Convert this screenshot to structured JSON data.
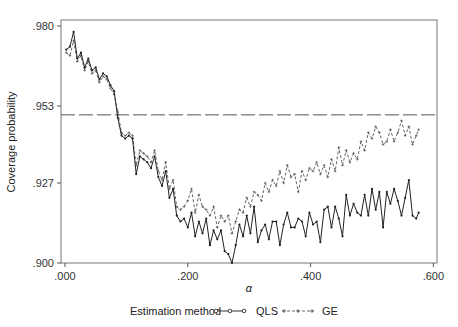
{
  "chart_data": {
    "type": "line",
    "title": "",
    "xlabel": "α",
    "ylabel": "Coverage probability",
    "xlim": [
      0.0,
      0.6
    ],
    "ylim": [
      0.9,
      0.98
    ],
    "x_ticks": [
      ".000",
      ".200",
      ".400",
      ".600"
    ],
    "x_tick_values": [
      0.0,
      0.2,
      0.4,
      0.6
    ],
    "y_ticks": [
      ".900",
      ".927",
      ".953",
      ".980"
    ],
    "y_tick_values": [
      0.9,
      0.927,
      0.953,
      0.98
    ],
    "grid": false,
    "reference_line": {
      "y": 0.95,
      "style": "long-dash"
    },
    "legend": {
      "title": "Estimation method",
      "position": "bottom",
      "entries": [
        {
          "label": "QLS",
          "style": "solid-circle-markers"
        },
        {
          "label": "GE",
          "style": "dashed-plus-markers"
        }
      ]
    },
    "x": [
      0.002,
      0.008,
      0.014,
      0.02,
      0.026,
      0.032,
      0.038,
      0.044,
      0.05,
      0.056,
      0.062,
      0.068,
      0.074,
      0.08,
      0.086,
      0.092,
      0.098,
      0.104,
      0.11,
      0.116,
      0.122,
      0.128,
      0.134,
      0.14,
      0.146,
      0.152,
      0.158,
      0.164,
      0.17,
      0.176,
      0.182,
      0.188,
      0.194,
      0.2,
      0.206,
      0.212,
      0.218,
      0.224,
      0.23,
      0.236,
      0.242,
      0.248,
      0.254,
      0.26,
      0.266,
      0.272,
      0.278,
      0.284,
      0.29,
      0.296,
      0.302,
      0.308,
      0.314,
      0.32,
      0.326,
      0.332,
      0.338,
      0.344,
      0.35,
      0.356,
      0.362,
      0.368,
      0.374,
      0.38,
      0.386,
      0.392,
      0.398,
      0.404,
      0.41,
      0.416,
      0.422,
      0.428,
      0.434,
      0.44,
      0.446,
      0.452,
      0.458,
      0.464,
      0.47,
      0.476,
      0.482,
      0.488,
      0.494,
      0.5,
      0.506,
      0.512,
      0.518,
      0.524,
      0.53,
      0.536,
      0.542,
      0.548,
      0.554,
      0.56,
      0.566,
      0.572,
      0.576
    ],
    "series": [
      {
        "name": "QLS",
        "values": [
          0.972,
          0.973,
          0.978,
          0.969,
          0.971,
          0.966,
          0.969,
          0.965,
          0.966,
          0.962,
          0.964,
          0.963,
          0.96,
          0.958,
          0.949,
          0.943,
          0.942,
          0.943,
          0.942,
          0.93,
          0.936,
          0.935,
          0.934,
          0.932,
          0.936,
          0.929,
          0.926,
          0.931,
          0.922,
          0.925,
          0.916,
          0.914,
          0.915,
          0.912,
          0.917,
          0.909,
          0.914,
          0.91,
          0.915,
          0.906,
          0.911,
          0.908,
          0.911,
          0.904,
          0.903,
          0.9,
          0.906,
          0.913,
          0.909,
          0.916,
          0.91,
          0.919,
          0.907,
          0.911,
          0.913,
          0.908,
          0.914,
          0.914,
          0.906,
          0.913,
          0.917,
          0.912,
          0.912,
          0.915,
          0.914,
          0.909,
          0.917,
          0.913,
          0.914,
          0.907,
          0.918,
          0.919,
          0.912,
          0.919,
          0.915,
          0.909,
          0.923,
          0.916,
          0.92,
          0.917,
          0.916,
          0.923,
          0.916,
          0.925,
          0.918,
          0.924,
          0.912,
          0.924,
          0.92,
          0.925,
          0.921,
          0.916,
          0.922,
          0.928,
          0.916,
          0.915,
          0.917
        ]
      },
      {
        "name": "GE",
        "values": [
          0.971,
          0.97,
          0.975,
          0.968,
          0.97,
          0.965,
          0.968,
          0.964,
          0.965,
          0.961,
          0.963,
          0.962,
          0.959,
          0.957,
          0.951,
          0.944,
          0.943,
          0.944,
          0.943,
          0.933,
          0.938,
          0.937,
          0.936,
          0.934,
          0.938,
          0.931,
          0.928,
          0.934,
          0.925,
          0.928,
          0.919,
          0.918,
          0.919,
          0.921,
          0.925,
          0.917,
          0.923,
          0.919,
          0.918,
          0.916,
          0.919,
          0.912,
          0.916,
          0.914,
          0.916,
          0.91,
          0.914,
          0.918,
          0.917,
          0.922,
          0.919,
          0.924,
          0.923,
          0.921,
          0.927,
          0.924,
          0.928,
          0.926,
          0.931,
          0.927,
          0.933,
          0.929,
          0.93,
          0.924,
          0.931,
          0.928,
          0.932,
          0.931,
          0.934,
          0.93,
          0.933,
          0.929,
          0.935,
          0.931,
          0.939,
          0.933,
          0.938,
          0.934,
          0.937,
          0.935,
          0.941,
          0.938,
          0.944,
          0.942,
          0.946,
          0.944,
          0.94,
          0.941,
          0.945,
          0.941,
          0.944,
          0.948,
          0.943,
          0.946,
          0.94,
          0.943,
          0.945
        ]
      }
    ]
  }
}
